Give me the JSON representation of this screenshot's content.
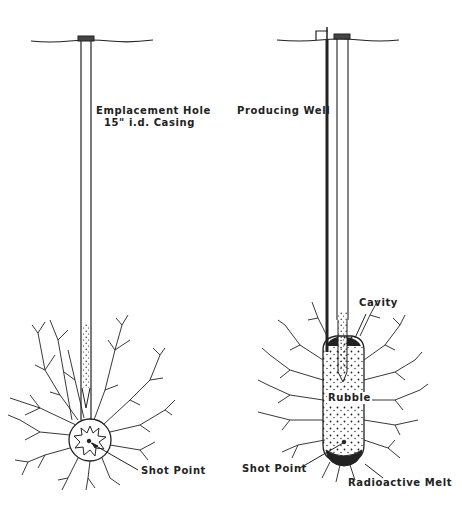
{
  "diagram": {
    "left_panel": {
      "name": "emplacement",
      "labels": {
        "hole_line1": "Emplacement Hole",
        "hole_line2": "15\" i.d. Casing",
        "shot_point": "Shot Point"
      }
    },
    "right_panel": {
      "name": "post-shot",
      "labels": {
        "producing_well": "Producing Well",
        "cavity": "Cavity",
        "rubble": "Rubble",
        "shot_point": "Shot Point",
        "radioactive_melt": "Radioactive Melt"
      }
    },
    "colors": {
      "ink": "#222222",
      "background": "#ffffff"
    }
  }
}
